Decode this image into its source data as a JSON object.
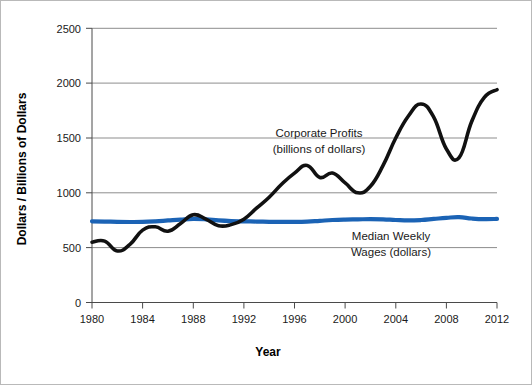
{
  "chart_data": {
    "type": "line",
    "title": "",
    "xlabel": "Year",
    "ylabel": "Dollars / Billions of Dollars",
    "xlim": [
      1980,
      2012
    ],
    "ylim": [
      0,
      2500
    ],
    "grid": true,
    "legend_position": "inline-annotations",
    "x_ticks": [
      "1980",
      "1984",
      "1988",
      "1992",
      "1996",
      "2000",
      "2004",
      "2008",
      "2012"
    ],
    "y_ticks": [
      "0",
      "500",
      "1000",
      "1500",
      "2000",
      "2500"
    ],
    "x": [
      1980,
      1981,
      1982,
      1983,
      1984,
      1985,
      1986,
      1987,
      1988,
      1989,
      1990,
      1991,
      1992,
      1993,
      1994,
      1995,
      1996,
      1997,
      1998,
      1999,
      2000,
      2001,
      2002,
      2003,
      2004,
      2005,
      2006,
      2007,
      2008,
      2009,
      2010,
      2011,
      2012
    ],
    "series": [
      {
        "name": "Corporate Profits",
        "label": "Corporate Profits",
        "sublabel": "(billions of dollars)",
        "color": "#111111",
        "units": "billions of dollars",
        "values": [
          550,
          560,
          470,
          530,
          660,
          690,
          650,
          720,
          800,
          760,
          700,
          710,
          760,
          860,
          960,
          1080,
          1180,
          1250,
          1140,
          1180,
          1090,
          1000,
          1060,
          1250,
          1500,
          1700,
          1810,
          1690,
          1400,
          1320,
          1650,
          1870,
          1940
        ]
      },
      {
        "name": "Median Weekly Wages",
        "label": "Median Weekly",
        "sublabel": "Wages (dollars)",
        "color": "#1b63b5",
        "units": "dollars",
        "values": [
          740,
          738,
          735,
          734,
          735,
          740,
          748,
          756,
          762,
          758,
          748,
          742,
          740,
          738,
          736,
          735,
          735,
          738,
          745,
          752,
          756,
          758,
          760,
          758,
          752,
          748,
          752,
          762,
          772,
          778,
          766,
          760,
          762
        ]
      }
    ],
    "annotations": [
      {
        "name": "corporate-profits-annotation",
        "line1": "Corporate Profits",
        "line2": "(billions of dollars)"
      },
      {
        "name": "median-weekly-wages-annotation",
        "line1": "Median Weekly",
        "line2": "Wages (dollars)"
      }
    ]
  }
}
